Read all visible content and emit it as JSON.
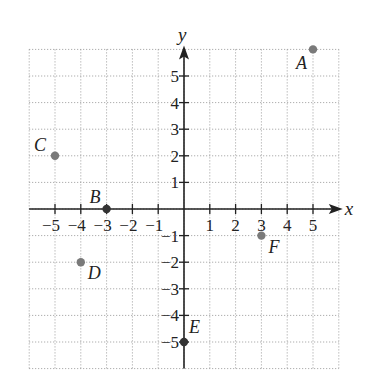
{
  "chart_data": {
    "type": "scatter",
    "title": "",
    "xlabel": "x",
    "ylabel": "y",
    "xlim": [
      -6,
      6
    ],
    "ylim": [
      -6,
      6
    ],
    "grid": true,
    "grid_style": "dotted",
    "x_ticks": [
      -5,
      -4,
      -3,
      -2,
      -1,
      1,
      2,
      3,
      4,
      5
    ],
    "y_ticks": [
      5,
      4,
      3,
      2,
      1,
      -1,
      -2,
      -3,
      -4,
      -5
    ],
    "x_tick_labels": [
      "−5",
      "−4",
      "−3",
      "−2",
      "−1",
      "1",
      "2",
      "3",
      "4",
      "5"
    ],
    "y_tick_labels": [
      "5",
      "4",
      "3",
      "2",
      "1",
      "−1",
      "−2",
      "−3",
      "−4",
      "−5"
    ],
    "points": [
      {
        "label": "A",
        "x": 5,
        "y": 6
      },
      {
        "label": "B",
        "x": -3,
        "y": 0
      },
      {
        "label": "C",
        "x": -5,
        "y": 2
      },
      {
        "label": "D",
        "x": -4,
        "y": -2
      },
      {
        "label": "E",
        "x": 0,
        "y": -5
      },
      {
        "label": "F",
        "x": 3,
        "y": -1
      }
    ],
    "point_color": "#7a7a7a",
    "axis_color": "#222222",
    "grid_color": "#9a9a9a"
  }
}
